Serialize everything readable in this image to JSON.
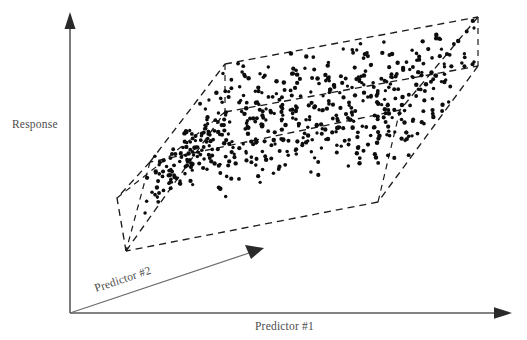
{
  "figure": {
    "domain": "Diagram",
    "background_color": "#ffffff",
    "width": 527,
    "height": 340,
    "cropped_caption_top": "",
    "axes": {
      "vertical": {
        "label": "Response",
        "name": "response-axis",
        "color": "#5a5a5a",
        "origin": [
          70,
          313
        ],
        "tip": [
          70,
          13
        ],
        "label_position": [
          12,
          124
        ]
      },
      "horizontal": {
        "label": "Predictor #1",
        "name": "predictor-1-axis",
        "color": "#5a5a5a",
        "origin": [
          70,
          313
        ],
        "tip": [
          512,
          313
        ],
        "label_position": [
          255,
          328
        ]
      },
      "depth": {
        "label": "Predictor #2",
        "name": "predictor-2-axis",
        "color": "#6a6a6a",
        "origin": [
          70,
          313
        ],
        "tip": [
          264,
          248
        ],
        "label_position": [
          96,
          290
        ],
        "label_rotation_deg": -18.5
      }
    },
    "region": {
      "name": "data-cloud-parallelepiped",
      "edge_color": "#1c1c1c",
      "edge_style": "dashed",
      "vertices": {
        "top_back_left": [
          225,
          64
        ],
        "top_back_right": [
          478,
          17
        ],
        "top_front_right": [
          400,
          110
        ],
        "top_front_left": [
          150,
          162
        ],
        "bottom_back_left": [
          225,
          112
        ],
        "bottom_back_right": [
          478,
          66
        ],
        "bottom_front_right": [
          378,
          202
        ],
        "bottom_front_left": [
          126,
          251
        ],
        "left_outer_upper": [
          117,
          198
        ],
        "left_outer_lower": [
          126,
          251
        ]
      }
    },
    "point_cloud": {
      "name": "scatter-points",
      "color": "#0d0d0d",
      "approx_count": 520,
      "radius_px": 1.9
    }
  },
  "chart_data": {
    "type": "scatter",
    "title": "",
    "xlabel": "Predictor #1",
    "ylabel": "Response",
    "zlabel": "Predictor #2",
    "grid": false,
    "legend": null,
    "annotations": []
  }
}
